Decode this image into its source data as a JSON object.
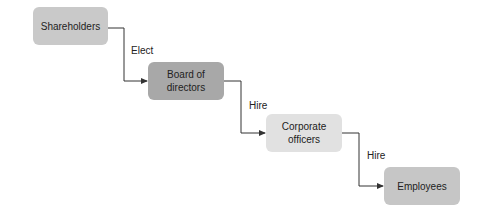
{
  "diagram": {
    "type": "org-flow",
    "nodes": [
      {
        "id": "shareholders",
        "label": "Shareholders",
        "color": "#c9c9c9"
      },
      {
        "id": "board",
        "label": "Board of directors",
        "line1": "Board of",
        "line2": "directors",
        "color": "#a8a8a8"
      },
      {
        "id": "officers",
        "label": "Corporate officers",
        "line1": "Corporate",
        "line2": "officers",
        "color": "#e1e1e1"
      },
      {
        "id": "employees",
        "label": "Employees",
        "color": "#c6c6c6"
      }
    ],
    "edges": [
      {
        "from": "shareholders",
        "to": "board",
        "label": "Elect"
      },
      {
        "from": "board",
        "to": "officers",
        "label": "Hire"
      },
      {
        "from": "officers",
        "to": "employees",
        "label": "Hire"
      }
    ],
    "line_color": "#333333"
  }
}
